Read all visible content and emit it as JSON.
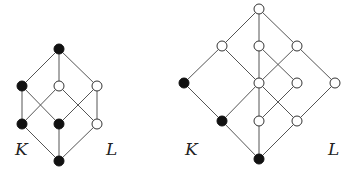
{
  "diagrams": [
    {
      "id": "left-lattice",
      "labels": [
        {
          "text": "K",
          "x": 15,
          "y": 155
        },
        {
          "text": "L",
          "x": 106,
          "y": 155
        }
      ],
      "nodes": [
        {
          "x": 59,
          "y": 49,
          "filled": true
        },
        {
          "x": 22,
          "y": 86,
          "filled": true
        },
        {
          "x": 59,
          "y": 86,
          "filled": false
        },
        {
          "x": 97,
          "y": 86,
          "filled": false
        },
        {
          "x": 22,
          "y": 124,
          "filled": true
        },
        {
          "x": 59,
          "y": 124,
          "filled": true
        },
        {
          "x": 97,
          "y": 124,
          "filled": false
        },
        {
          "x": 59,
          "y": 161,
          "filled": true
        }
      ],
      "edges": [
        [
          0,
          1
        ],
        [
          0,
          2
        ],
        [
          0,
          3
        ],
        [
          1,
          4
        ],
        [
          1,
          5
        ],
        [
          2,
          4
        ],
        [
          2,
          6
        ],
        [
          3,
          5
        ],
        [
          3,
          6
        ],
        [
          4,
          7
        ],
        [
          5,
          7
        ],
        [
          6,
          7
        ]
      ]
    },
    {
      "id": "right-lattice",
      "labels": [
        {
          "text": "K",
          "x": 185,
          "y": 155
        },
        {
          "text": "L",
          "x": 328,
          "y": 155
        }
      ],
      "nodes": [
        {
          "x": 259,
          "y": 9,
          "filled": false
        },
        {
          "x": 222,
          "y": 46,
          "filled": false
        },
        {
          "x": 259,
          "y": 46,
          "filled": false
        },
        {
          "x": 297,
          "y": 46,
          "filled": false
        },
        {
          "x": 184,
          "y": 83,
          "filled": true
        },
        {
          "x": 259,
          "y": 83,
          "filled": false
        },
        {
          "x": 297,
          "y": 83,
          "filled": false
        },
        {
          "x": 335,
          "y": 83,
          "filled": false
        },
        {
          "x": 222,
          "y": 121,
          "filled": true
        },
        {
          "x": 259,
          "y": 121,
          "filled": false
        },
        {
          "x": 297,
          "y": 121,
          "filled": false
        },
        {
          "x": 259,
          "y": 159,
          "filled": true
        }
      ],
      "edges": [
        [
          0,
          1
        ],
        [
          0,
          2
        ],
        [
          0,
          3
        ],
        [
          1,
          4
        ],
        [
          1,
          5
        ],
        [
          2,
          5
        ],
        [
          2,
          6
        ],
        [
          3,
          5
        ],
        [
          3,
          7
        ],
        [
          4,
          8
        ],
        [
          5,
          8
        ],
        [
          5,
          9
        ],
        [
          5,
          10
        ],
        [
          6,
          9
        ],
        [
          7,
          10
        ],
        [
          8,
          11
        ],
        [
          9,
          11
        ],
        [
          10,
          11
        ]
      ]
    }
  ],
  "style": {
    "filled_color": "#111111",
    "open_fill": "#ffffff",
    "edge_color": "#555555",
    "node_radius": 5
  }
}
